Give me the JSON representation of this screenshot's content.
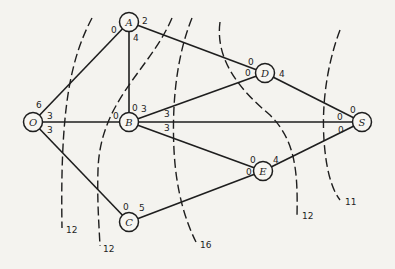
{
  "diagram": {
    "type": "network flow graph with cuts",
    "nodes": [
      {
        "id": "O",
        "label": "O",
        "x": 33,
        "y": 122
      },
      {
        "id": "A",
        "label": "A",
        "x": 129,
        "y": 22
      },
      {
        "id": "B",
        "label": "B",
        "x": 129,
        "y": 122
      },
      {
        "id": "C",
        "label": "C",
        "x": 129,
        "y": 222
      },
      {
        "id": "D",
        "label": "D",
        "x": 265,
        "y": 73
      },
      {
        "id": "E",
        "label": "E",
        "x": 263,
        "y": 171
      },
      {
        "id": "S",
        "label": "S",
        "x": 362,
        "y": 122
      }
    ],
    "edges": [
      {
        "from": "O",
        "to": "A",
        "cap_from": "6",
        "cap_to": "0"
      },
      {
        "from": "O",
        "to": "B",
        "cap_from": "3",
        "cap_to": "0"
      },
      {
        "from": "O",
        "to": "C",
        "cap_from": "3",
        "cap_to": "0"
      },
      {
        "from": "A",
        "to": "B",
        "cap_from": "4",
        "cap_to": "0"
      },
      {
        "from": "A",
        "to": "D",
        "cap_from": "2",
        "cap_to": "0"
      },
      {
        "from": "B",
        "to": "D",
        "cap_from": "3",
        "cap_to": "0"
      },
      {
        "from": "B",
        "to": "S",
        "cap_from": "3",
        "cap_to": "0"
      },
      {
        "from": "B",
        "to": "E",
        "cap_from": "3",
        "cap_to": "0"
      },
      {
        "from": "C",
        "to": "E",
        "cap_from": "5",
        "cap_to": "0"
      },
      {
        "from": "D",
        "to": "S",
        "cap_from": "4",
        "cap_to": "0"
      },
      {
        "from": "E",
        "to": "S",
        "cap_from": "4",
        "cap_to": "0"
      }
    ],
    "capacity_labels": [
      {
        "text": "6",
        "x": 36,
        "y": 108
      },
      {
        "text": "3",
        "x": 47,
        "y": 119
      },
      {
        "text": "3",
        "x": 47,
        "y": 133
      },
      {
        "text": "0",
        "x": 111,
        "y": 33
      },
      {
        "text": "2",
        "x": 142,
        "y": 24
      },
      {
        "text": "4",
        "x": 133,
        "y": 41
      },
      {
        "text": "0",
        "x": 132,
        "y": 111
      },
      {
        "text": "3",
        "x": 141,
        "y": 112
      },
      {
        "text": "0",
        "x": 113,
        "y": 119
      },
      {
        "text": "3",
        "x": 164,
        "y": 117
      },
      {
        "text": "3",
        "x": 164,
        "y": 131
      },
      {
        "text": "0",
        "x": 123,
        "y": 210
      },
      {
        "text": "5",
        "x": 139,
        "y": 211
      },
      {
        "text": "0",
        "x": 248,
        "y": 65
      },
      {
        "text": "0",
        "x": 245,
        "y": 76
      },
      {
        "text": "4",
        "x": 279,
        "y": 77
      },
      {
        "text": "0",
        "x": 250,
        "y": 163
      },
      {
        "text": "0",
        "x": 246,
        "y": 175
      },
      {
        "text": "4",
        "x": 273,
        "y": 163
      },
      {
        "text": "0",
        "x": 350,
        "y": 113
      },
      {
        "text": "0",
        "x": 337,
        "y": 120
      },
      {
        "text": "0",
        "x": 338,
        "y": 133
      }
    ],
    "cuts": [
      {
        "label": "12",
        "path": "M 92 18 C 70 60, 60 110, 62 228",
        "label_x": 66,
        "label_y": 233
      },
      {
        "label": "12",
        "path": "M 172 18 C 150 70, 100 100, 98 170 C 97 200, 99 225, 100 246",
        "label_x": 103,
        "label_y": 252
      },
      {
        "label": "16",
        "path": "M 192 18 C 175 60, 172 110, 174 150 C 176 190, 185 220, 196 242",
        "label_x": 200,
        "label_y": 248
      },
      {
        "label": "12",
        "path": "M 220 22 C 215 60, 240 90, 270 115 C 295 140, 298 170, 297 216",
        "label_x": 302,
        "label_y": 219
      },
      {
        "label": "11",
        "path": "M 340 30 C 325 70, 322 110, 324 140 C 326 170, 332 190, 340 200",
        "label_x": 345,
        "label_y": 205
      }
    ]
  }
}
